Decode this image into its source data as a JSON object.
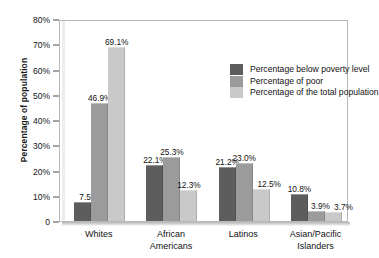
{
  "chart_data": {
    "type": "bar",
    "title": "",
    "xlabel": "",
    "ylabel": "Percentage of population",
    "ylim": [
      0,
      80
    ],
    "ytick_values": [
      80,
      70,
      60,
      50,
      40,
      30,
      20,
      10,
      0
    ],
    "ytick_labels": [
      "80%",
      "70%",
      "60%",
      "50%",
      "40%",
      "30%",
      "20%",
      "10%",
      "0"
    ],
    "grid": false,
    "legend_position": "upper right (inside plot)",
    "categories": [
      "Whites",
      "African Americans",
      "Latinos",
      "Asian/Pacific Islanders"
    ],
    "category_lines": [
      [
        "Whites"
      ],
      [
        "African",
        "Americans"
      ],
      [
        "Latinos"
      ],
      [
        "Asian/Pacific",
        "Islanders"
      ]
    ],
    "series": [
      {
        "name": "Percentage below poverty level",
        "color": "#5d5d5d",
        "values": [
          7.5,
          22.1,
          21.2,
          10.8
        ],
        "labels": [
          "7.5%",
          "22.1%",
          "21.2%",
          "10.8%"
        ]
      },
      {
        "name": "Percentage of poor",
        "color": "#9b9b9b",
        "values": [
          46.9,
          25.3,
          23.0,
          3.9
        ],
        "labels": [
          "46.9%",
          "25.3%",
          "23.0%",
          "3.9%"
        ]
      },
      {
        "name": "Percentage of the total population",
        "color": "#c9c9c9",
        "values": [
          69.1,
          12.3,
          12.5,
          3.7
        ],
        "labels": [
          "69.1%",
          "12.3%",
          "12.5%",
          "3.7%"
        ]
      }
    ]
  },
  "colors": {
    "series_1": "#5d5d5d",
    "series_2": "#9b9b9b",
    "series_3": "#c9c9c9",
    "axis": "#4a4a4a",
    "text": "#111111",
    "plot_background": "#ffffff"
  }
}
